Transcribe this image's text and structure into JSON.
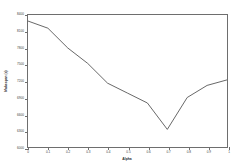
{
  "chart_data": {
    "type": "line",
    "title": "",
    "xlabel": "Alpha",
    "ylabel": "Makespan (s)",
    "x": [
      0,
      0.1,
      0.2,
      0.3,
      0.4,
      0.5,
      0.6,
      0.7,
      0.8,
      0.9,
      1
    ],
    "values": [
      8290,
      8160,
      7800,
      7520,
      7160,
      6980,
      6800,
      6320,
      6900,
      7120,
      7220
    ],
    "xtick_labels": [
      "0",
      "0.1",
      "0.2",
      "0.3",
      "0.4",
      "0.5",
      "0.6",
      "0.7",
      "0.8",
      "0.9",
      "1"
    ],
    "ytick_values": [
      8400,
      8100,
      7800,
      7500,
      7200,
      6900,
      6600,
      6300,
      6000
    ],
    "ytick_labels": [
      "8400",
      "8100",
      "7800",
      "7500",
      "7200",
      "6900",
      "6600",
      "6300",
      "6000"
    ],
    "xlim": [
      0,
      1
    ],
    "ylim": [
      6000,
      8400
    ],
    "grid": false,
    "legend": null,
    "line_color": "#555555"
  }
}
